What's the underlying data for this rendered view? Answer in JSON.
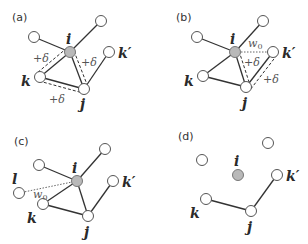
{
  "figure": {
    "colors": {
      "edge": "#333333",
      "node_fill": "#ffffff",
      "node_stroke": "#555555",
      "focal_fill": "#b9b9b9"
    },
    "panels": [
      {
        "label": "(a)",
        "nodes": [
          {
            "id": "u1",
            "label": ""
          },
          {
            "id": "u2",
            "label": ""
          },
          {
            "id": "i",
            "label": "i",
            "focal": true
          },
          {
            "id": "kp",
            "label": "k′"
          },
          {
            "id": "k",
            "label": "k"
          },
          {
            "id": "j",
            "label": "j"
          }
        ],
        "edges": [
          {
            "from": "u1",
            "to": "i",
            "style": "solid"
          },
          {
            "from": "u2",
            "to": "i",
            "style": "solid"
          },
          {
            "from": "i",
            "to": "k",
            "style": "solid",
            "reinforced": true
          },
          {
            "from": "i",
            "to": "j",
            "style": "solid",
            "reinforced": true
          },
          {
            "from": "k",
            "to": "j",
            "style": "solid",
            "reinforced": true
          },
          {
            "from": "kp",
            "to": "j",
            "style": "solid"
          }
        ],
        "edge_labels": [
          "+δ",
          "+δ",
          "+δ"
        ]
      },
      {
        "label": "(b)",
        "nodes": [
          {
            "id": "u1",
            "label": ""
          },
          {
            "id": "u2",
            "label": ""
          },
          {
            "id": "i",
            "label": "i",
            "focal": true
          },
          {
            "id": "kp",
            "label": "k′"
          },
          {
            "id": "k",
            "label": "k"
          },
          {
            "id": "j",
            "label": "j"
          }
        ],
        "edges": [
          {
            "from": "u1",
            "to": "i",
            "style": "solid"
          },
          {
            "from": "u2",
            "to": "i",
            "style": "solid"
          },
          {
            "from": "i",
            "to": "k",
            "style": "solid"
          },
          {
            "from": "i",
            "to": "j",
            "style": "solid",
            "reinforced": true
          },
          {
            "from": "k",
            "to": "j",
            "style": "solid"
          },
          {
            "from": "kp",
            "to": "j",
            "style": "solid",
            "reinforced": true
          },
          {
            "from": "i",
            "to": "kp",
            "style": "dotted",
            "weight": "w0"
          }
        ],
        "edge_labels": [
          "w0",
          "+δ",
          "+δ"
        ]
      },
      {
        "label": "(c)",
        "nodes": [
          {
            "id": "u1",
            "label": ""
          },
          {
            "id": "u2",
            "label": ""
          },
          {
            "id": "i",
            "label": "i",
            "focal": true
          },
          {
            "id": "kp",
            "label": "k′"
          },
          {
            "id": "k",
            "label": "k"
          },
          {
            "id": "j",
            "label": "j"
          },
          {
            "id": "l",
            "label": "l"
          }
        ],
        "edges": [
          {
            "from": "u1",
            "to": "i",
            "style": "solid"
          },
          {
            "from": "u2",
            "to": "i",
            "style": "solid"
          },
          {
            "from": "i",
            "to": "k",
            "style": "solid"
          },
          {
            "from": "i",
            "to": "j",
            "style": "solid"
          },
          {
            "from": "k",
            "to": "j",
            "style": "solid"
          },
          {
            "from": "kp",
            "to": "j",
            "style": "solid"
          },
          {
            "from": "l",
            "to": "i",
            "style": "dotted",
            "weight": "w0"
          }
        ],
        "edge_labels": [
          "w0"
        ]
      },
      {
        "label": "(d)",
        "nodes": [
          {
            "id": "u1",
            "label": ""
          },
          {
            "id": "u2",
            "label": ""
          },
          {
            "id": "i",
            "label": "i",
            "focal": true
          },
          {
            "id": "kp",
            "label": "k′"
          },
          {
            "id": "k",
            "label": "k"
          },
          {
            "id": "j",
            "label": "j"
          }
        ],
        "edges": [
          {
            "from": "k",
            "to": "j",
            "style": "solid"
          },
          {
            "from": "kp",
            "to": "j",
            "style": "solid"
          }
        ],
        "edge_labels": []
      }
    ]
  }
}
